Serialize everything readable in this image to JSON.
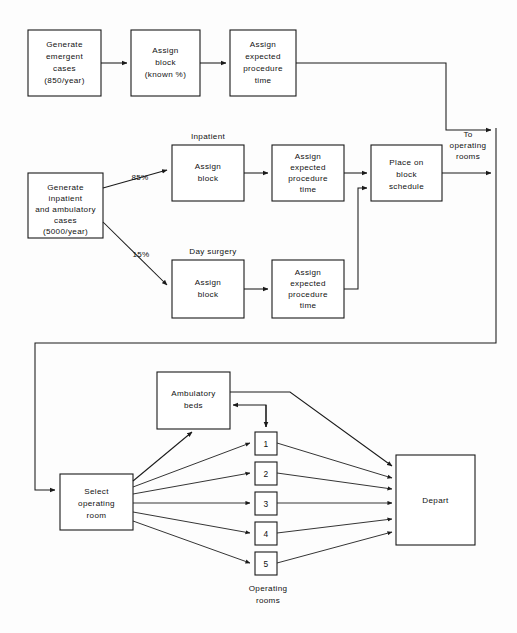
{
  "diagram": {
    "colors": {
      "line": "#1a1a1a",
      "box_fill": "#ffffff",
      "text": "#111111",
      "background": "#fdfdfd"
    },
    "emergent_flow": {
      "generate": {
        "line1": "Generate",
        "line2": "emergent",
        "line3": "cases",
        "line4": "(850/year)"
      },
      "assign_block": {
        "line1": "Assign",
        "line2": "block",
        "line3": "(known %)"
      },
      "assign_time": {
        "line1": "Assign",
        "line2": "expected",
        "line3": "procedure",
        "line4": "time"
      }
    },
    "scheduled_flow": {
      "generate": {
        "line1": "Generate",
        "line2": "inpatient",
        "line3": "and ambulatory",
        "line4": "cases",
        "line5": "(5000/year)"
      },
      "branch_inpatient_pct": "85%",
      "branch_daysurgery_pct": "15%",
      "inpatient_label": "Inpatient",
      "daysurgery_label": "Day surgery",
      "inpatient_assign_block": {
        "line1": "Assign",
        "line2": "block"
      },
      "inpatient_assign_time": {
        "line1": "Assign",
        "line2": "expected",
        "line3": "procedure",
        "line4": "time"
      },
      "daysurgery_assign_block": {
        "line1": "Assign",
        "line2": "block"
      },
      "daysurgery_assign_time": {
        "line1": "Assign",
        "line2": "expected",
        "line3": "procedure",
        "line4": "time"
      },
      "place_on_block": {
        "line1": "Place on",
        "line2": "block",
        "line3": "schedule"
      },
      "to_operating_rooms": {
        "line1": "To",
        "line2": "operating",
        "line3": "rooms"
      }
    },
    "or_flow": {
      "select_room": {
        "line1": "Select",
        "line2": "operating",
        "line3": "room"
      },
      "ambulatory_beds": {
        "line1": "Ambulatory",
        "line2": "beds"
      },
      "depart": {
        "line1": "Depart"
      },
      "operating_rooms_caption": {
        "line1": "Operating",
        "line2": "rooms"
      },
      "rooms": [
        {
          "id": "or-1",
          "label": "1"
        },
        {
          "id": "or-2",
          "label": "2"
        },
        {
          "id": "or-3",
          "label": "3"
        },
        {
          "id": "or-4",
          "label": "4"
        },
        {
          "id": "or-5",
          "label": "5"
        }
      ]
    }
  }
}
